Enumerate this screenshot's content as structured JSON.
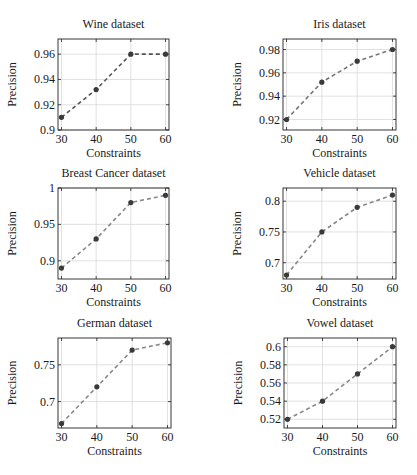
{
  "chart_data": [
    {
      "type": "line",
      "title": "Wine dataset",
      "xlabel": "Constraints",
      "ylabel": "Precision",
      "x": [
        30,
        40,
        50,
        60
      ],
      "values": [
        0.91,
        0.932,
        0.96,
        0.96
      ],
      "xticks": [
        30,
        40,
        50,
        60
      ],
      "yticks": [
        0.9,
        0.92,
        0.94,
        0.96
      ],
      "ytick_labels": [
        "0.9",
        "0.92",
        "0.94",
        "0.96"
      ],
      "ylim": [
        0.9,
        0.972
      ],
      "grid": true,
      "style": {
        "line": "dashed",
        "marker": "circle",
        "color": "#555555"
      }
    },
    {
      "type": "line",
      "title": "Iris dataset",
      "xlabel": "Constraints",
      "ylabel": "Precision",
      "x": [
        30,
        40,
        50,
        60
      ],
      "values": [
        0.92,
        0.952,
        0.97,
        0.98
      ],
      "xticks": [
        30,
        40,
        50,
        60
      ],
      "yticks": [
        0.92,
        0.94,
        0.96,
        0.98
      ],
      "ytick_labels": [
        "0.92",
        "0.94",
        "0.96",
        "0.98"
      ],
      "ylim": [
        0.911,
        0.989
      ],
      "grid": true,
      "style": {
        "line": "dashed",
        "marker": "circle",
        "color": "#777777"
      }
    },
    {
      "type": "line",
      "title": "Breast Cancer dataset",
      "xlabel": "Constraints",
      "ylabel": "Precision",
      "x": [
        30,
        40,
        50,
        60
      ],
      "values": [
        0.89,
        0.93,
        0.98,
        0.99
      ],
      "xticks": [
        30,
        40,
        50,
        60
      ],
      "yticks": [
        0.9,
        0.95,
        1.0
      ],
      "ytick_labels": [
        "0.9",
        "0.95",
        "1"
      ],
      "ylim": [
        0.875,
        1.0
      ],
      "grid": true,
      "style": {
        "line": "dashed",
        "marker": "circle",
        "color": "#888888"
      }
    },
    {
      "type": "line",
      "title": "Vehicle dataset",
      "xlabel": "Constraints",
      "ylabel": "Precision",
      "x": [
        30,
        40,
        50,
        60
      ],
      "values": [
        0.68,
        0.75,
        0.79,
        0.81
      ],
      "xticks": [
        30,
        40,
        50,
        60
      ],
      "yticks": [
        0.7,
        0.75,
        0.8
      ],
      "ytick_labels": [
        "0.7",
        "0.75",
        "0.8"
      ],
      "ylim": [
        0.6735,
        0.8215
      ],
      "grid": true,
      "style": {
        "line": "dashed",
        "marker": "circle",
        "color": "#888888"
      }
    },
    {
      "type": "line",
      "title": "German dataset",
      "xlabel": "Constraints",
      "ylabel": "Precision",
      "x": [
        30,
        40,
        50,
        60
      ],
      "values": [
        0.67,
        0.72,
        0.77,
        0.78
      ],
      "xticks": [
        30,
        40,
        50,
        60
      ],
      "yticks": [
        0.7,
        0.75
      ],
      "ytick_labels": [
        "0.7",
        "0.75"
      ],
      "ylim": [
        0.664,
        0.7865
      ],
      "grid": true,
      "style": {
        "line": "dashed",
        "marker": "circle",
        "color": "#888888"
      }
    },
    {
      "type": "line",
      "title": "Vowel dataset",
      "xlabel": "Constraints",
      "ylabel": "Precision",
      "x": [
        30,
        40,
        50,
        60
      ],
      "values": [
        0.52,
        0.54,
        0.57,
        0.6
      ],
      "xticks": [
        30,
        40,
        50,
        60
      ],
      "yticks": [
        0.52,
        0.54,
        0.56,
        0.58,
        0.6
      ],
      "ytick_labels": [
        "0.52",
        "0.54",
        "0.56",
        "0.58",
        "0.6"
      ],
      "ylim": [
        0.5104,
        0.6096
      ],
      "grid": true,
      "style": {
        "line": "dashed",
        "marker": "circle",
        "color": "#888888"
      }
    }
  ],
  "layout": {
    "panels": [
      {
        "x0": 58,
        "x1": 169,
        "y0": 39,
        "y1": 130
      },
      {
        "x0": 283,
        "x1": 396,
        "y0": 39,
        "y1": 130
      },
      {
        "x0": 58,
        "x1": 169,
        "y0": 188,
        "y1": 279
      },
      {
        "x0": 283,
        "x1": 396,
        "y0": 188,
        "y1": 279
      },
      {
        "x0": 58,
        "x1": 171,
        "y0": 338,
        "y1": 428
      },
      {
        "x0": 284,
        "x1": 396,
        "y0": 338,
        "y1": 428
      }
    ],
    "xrange": [
      29,
      61
    ]
  }
}
